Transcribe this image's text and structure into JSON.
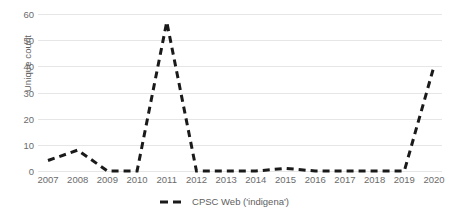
{
  "chart_data": {
    "type": "line",
    "title": "",
    "xlabel": "",
    "ylabel": "Unique count",
    "categories": [
      "2007",
      "2008",
      "2009",
      "2010",
      "2011",
      "2012",
      "2013",
      "2014",
      "2015",
      "2016",
      "2017",
      "2018",
      "2019",
      "2020"
    ],
    "series": [
      {
        "name": "CPSC Web ('indigena')",
        "values": [
          4,
          8,
          0,
          0,
          57,
          0,
          0,
          0,
          1,
          0,
          0,
          0,
          0,
          40
        ],
        "color": "#1a1a1a",
        "style": "dashed",
        "line_width": 3
      }
    ],
    "ylim": [
      0,
      60
    ],
    "yticks": [
      0,
      10,
      20,
      30,
      40,
      50,
      60
    ],
    "ytick_labels": [
      "0",
      "10",
      "20",
      "30",
      "40",
      "50",
      "60"
    ],
    "xtick_labels": [
      "2007",
      "2008",
      "2009",
      "2010",
      "2011",
      "2012",
      "2013",
      "2014",
      "2015",
      "2016",
      "2017",
      "2018",
      "2019",
      "2020"
    ],
    "grid": true,
    "grid_color": "#e6e6e6",
    "legend_position": "bottom",
    "background": "#ffffff"
  },
  "legend": {
    "entries": [
      {
        "label": "CPSC Web ('indigena')",
        "color": "#1a1a1a"
      }
    ]
  },
  "axes": {
    "y_title": "Unique count"
  }
}
